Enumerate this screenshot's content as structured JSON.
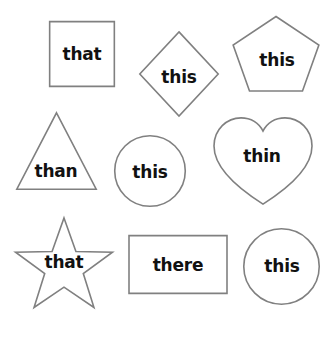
{
  "canvas": {
    "width": 336,
    "height": 342,
    "background": "#ffffff",
    "stroke_color": "#808080",
    "text_color": "#111111"
  },
  "shapes": [
    {
      "id": "square",
      "shape_name": "square",
      "word": "that",
      "x": 49,
      "y": 21,
      "w": 66,
      "h": 66,
      "label_x": 82,
      "label_y": 54
    },
    {
      "id": "diamond",
      "shape_name": "diamond",
      "word": "this",
      "x": 139,
      "y": 31,
      "w": 80,
      "h": 86,
      "label_x": 179,
      "label_y": 77
    },
    {
      "id": "pentagon",
      "shape_name": "pentagon",
      "word": "this",
      "x": 230,
      "y": 14,
      "w": 92,
      "h": 84,
      "label_x": 277,
      "label_y": 60
    },
    {
      "id": "triangle",
      "shape_name": "triangle",
      "word": "than",
      "x": 16,
      "y": 112,
      "w": 81,
      "h": 78,
      "label_x": 56,
      "label_y": 171
    },
    {
      "id": "circle-middle",
      "shape_name": "circle",
      "word": "this",
      "x": 114,
      "y": 135,
      "w": 72,
      "h": 72,
      "label_x": 150,
      "label_y": 172
    },
    {
      "id": "heart",
      "shape_name": "heart",
      "word": "thin",
      "x": 213,
      "y": 117,
      "w": 100,
      "h": 88,
      "label_x": 262,
      "label_y": 156
    },
    {
      "id": "star",
      "shape_name": "star",
      "word": "that",
      "x": 12,
      "y": 217,
      "w": 104,
      "h": 101,
      "label_x": 64,
      "label_y": 262
    },
    {
      "id": "rectangle",
      "shape_name": "rectangle",
      "word": "there",
      "x": 128,
      "y": 235,
      "w": 100,
      "h": 59,
      "label_x": 178,
      "label_y": 265
    },
    {
      "id": "circle-bottom",
      "shape_name": "circle",
      "word": "this",
      "x": 243,
      "y": 228,
      "w": 77,
      "h": 77,
      "label_x": 282,
      "label_y": 266
    }
  ]
}
